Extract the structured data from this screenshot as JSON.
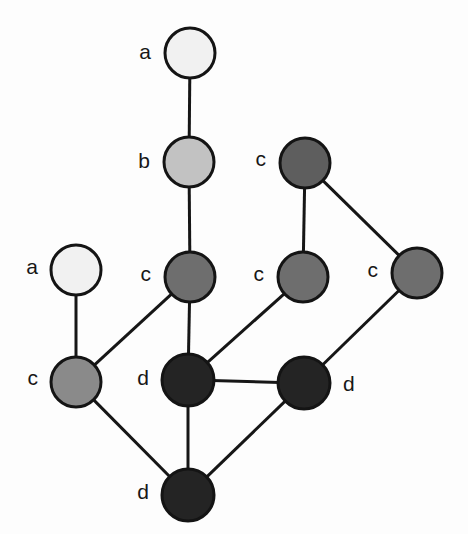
{
  "diagram": {
    "width": 468,
    "height": 534,
    "background_color": "#fdfdfd",
    "edge_color": "#161616",
    "node_outline_color": "#141414",
    "label_color": "#171717",
    "legend": {
      "a_fill": "#f0f0f0",
      "b_fill": "#c2c2c2",
      "c_fill": "#6e6e6e",
      "d_fill": "#242424"
    },
    "nodes": [
      {
        "id": "a1",
        "label": "a",
        "cx": 190,
        "cy": 53,
        "r": 25,
        "fill": "#f1f1f1",
        "label_side": "left",
        "label_x": 151,
        "label_y": 53
      },
      {
        "id": "b1",
        "label": "b",
        "cx": 189,
        "cy": 162,
        "r": 25,
        "fill": "#c2c2c2",
        "label_side": "left",
        "label_x": 150,
        "label_y": 162
      },
      {
        "id": "c1",
        "label": "c",
        "cx": 190,
        "cy": 277,
        "r": 25,
        "fill": "#6e6e6e",
        "label_side": "left",
        "label_x": 151,
        "label_y": 275
      },
      {
        "id": "a2",
        "label": "a",
        "cx": 76,
        "cy": 270,
        "r": 25,
        "fill": "#f1f1f1",
        "label_side": "left",
        "label_x": 38,
        "label_y": 268
      },
      {
        "id": "c5",
        "label": "c",
        "cx": 76,
        "cy": 382,
        "r": 25,
        "fill": "#8a8a8a",
        "label_side": "left",
        "label_x": 38,
        "label_y": 379
      },
      {
        "id": "c2",
        "label": "c",
        "cx": 305,
        "cy": 163,
        "r": 25,
        "fill": "#5e5e5e",
        "label_side": "left",
        "label_x": 266,
        "label_y": 160
      },
      {
        "id": "c3",
        "label": "c",
        "cx": 303,
        "cy": 277,
        "r": 25,
        "fill": "#6e6e6e",
        "label_side": "left",
        "label_x": 264,
        "label_y": 275
      },
      {
        "id": "c4",
        "label": "c",
        "cx": 417,
        "cy": 273,
        "r": 25,
        "fill": "#6e6e6e",
        "label_side": "left",
        "label_x": 378,
        "label_y": 271
      },
      {
        "id": "d1",
        "label": "d",
        "cx": 188,
        "cy": 380,
        "r": 26,
        "fill": "#242424",
        "label_side": "left",
        "label_x": 149,
        "label_y": 379
      },
      {
        "id": "d2",
        "label": "d",
        "cx": 304,
        "cy": 383,
        "r": 26,
        "fill": "#242424",
        "label_side": "right",
        "label_x": 343,
        "label_y": 385
      },
      {
        "id": "d3",
        "label": "d",
        "cx": 188,
        "cy": 495,
        "r": 26,
        "fill": "#242424",
        "label_side": "left",
        "label_x": 149,
        "label_y": 493
      }
    ],
    "edges": [
      {
        "id": "e-a1-b1",
        "from": "a1",
        "to": "b1"
      },
      {
        "id": "e-b1-c1",
        "from": "b1",
        "to": "c1"
      },
      {
        "id": "e-c1-d1",
        "from": "c1",
        "to": "d1"
      },
      {
        "id": "e-c1-c5",
        "from": "c1",
        "to": "c5"
      },
      {
        "id": "e-a2-c5",
        "from": "a2",
        "to": "c5"
      },
      {
        "id": "e-c5-d3",
        "from": "c5",
        "to": "d3"
      },
      {
        "id": "e-d1-d3",
        "from": "d1",
        "to": "d3"
      },
      {
        "id": "e-d1-d2",
        "from": "d1",
        "to": "d2"
      },
      {
        "id": "e-d1-c3",
        "from": "d1",
        "to": "c3"
      },
      {
        "id": "e-c3-c2",
        "from": "c3",
        "to": "c2"
      },
      {
        "id": "e-c2-c4",
        "from": "c2",
        "to": "c4"
      },
      {
        "id": "e-c4-d2",
        "from": "c4",
        "to": "d2"
      },
      {
        "id": "e-d2-d3",
        "from": "d2",
        "to": "d3"
      }
    ]
  }
}
